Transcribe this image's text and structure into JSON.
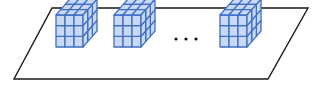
{
  "diagram": {
    "plane": {
      "points": [
        [
          52,
          8
        ],
        [
          308,
          8
        ],
        [
          268,
          79
        ],
        [
          14,
          79
        ]
      ],
      "stroke": "#1a1a1a",
      "fill": "#ffffff"
    },
    "cube_style": {
      "grid": 3,
      "line_color": "#3e6fc6",
      "fill_color": "#c9d8f3"
    },
    "cubes": [
      {
        "id": "cube-1",
        "x": 42,
        "y": 15
      },
      {
        "id": "cube-2",
        "x": 100,
        "y": 15
      },
      {
        "id": "cube-3",
        "x": 206,
        "y": 15
      }
    ],
    "ellipsis": {
      "text": "…",
      "dots": [
        [
          176,
          39
        ],
        [
          186,
          39
        ],
        [
          196,
          39
        ]
      ],
      "color": "#111111"
    }
  }
}
